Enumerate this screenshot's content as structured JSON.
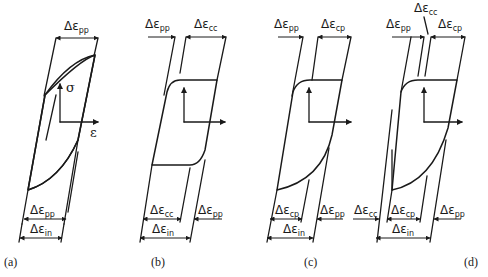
{
  "figure": {
    "delta": "Δε",
    "axes": {
      "stress_label": "σ",
      "strain_label": "ε"
    },
    "panels": [
      {
        "caption": "(a)",
        "top_labels": [
          {
            "sub": "pp"
          }
        ],
        "bottom_labels": [
          {
            "sub": "pp"
          },
          {
            "sub": "in"
          }
        ]
      },
      {
        "caption": "(b)",
        "top_labels": [
          {
            "sub": "pp"
          },
          {
            "sub": "cc"
          }
        ],
        "bottom_labels": [
          {
            "sub": "cc"
          },
          {
            "sub": "pp"
          },
          {
            "sub": "in"
          }
        ]
      },
      {
        "caption": "(c)",
        "top_labels": [
          {
            "sub": "pp"
          },
          {
            "sub": "cp"
          }
        ],
        "bottom_labels": [
          {
            "sub": "cp"
          },
          {
            "sub": "pp"
          },
          {
            "sub": "in"
          }
        ]
      },
      {
        "caption": "(d)",
        "top_labels": [
          {
            "sub": "pp"
          },
          {
            "sub": "cc"
          },
          {
            "sub": "cp"
          }
        ],
        "bottom_labels": [
          {
            "sub": "cc"
          },
          {
            "sub": "cp"
          },
          {
            "sub": "pp"
          },
          {
            "sub": "in"
          }
        ]
      }
    ]
  }
}
